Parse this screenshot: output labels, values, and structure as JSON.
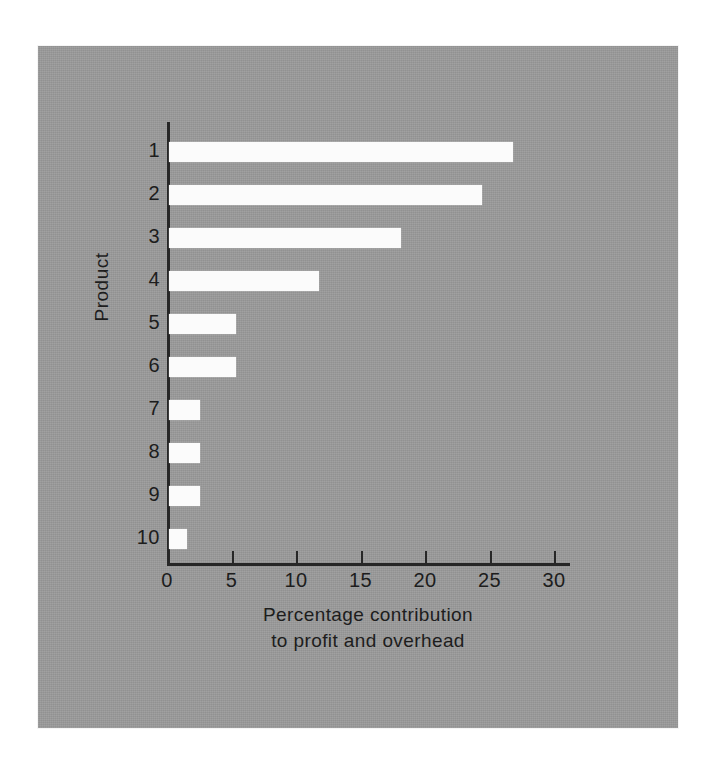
{
  "chart_data": {
    "type": "bar",
    "orientation": "horizontal",
    "title": "",
    "xlabel_line1": "Percentage contribution",
    "xlabel_line2": "to profit and overhead",
    "ylabel": "Product",
    "categories": [
      "1",
      "2",
      "3",
      "4",
      "5",
      "6",
      "7",
      "8",
      "9",
      "10"
    ],
    "values": [
      26.7,
      24.3,
      18.0,
      11.6,
      5.2,
      5.2,
      2.4,
      2.4,
      2.4,
      1.4
    ],
    "xlim": [
      0,
      31.2
    ],
    "xticks": [
      0,
      5,
      10,
      15,
      20,
      25,
      30
    ],
    "xtick_labels": [
      "0",
      "5",
      "10",
      "15",
      "20",
      "25",
      "30"
    ],
    "grid": false,
    "legend": false,
    "bar_color": "#fbfbfb",
    "axis_color": "#272727",
    "background_color": "#9b9b9b",
    "page_color": "#ffffff"
  }
}
